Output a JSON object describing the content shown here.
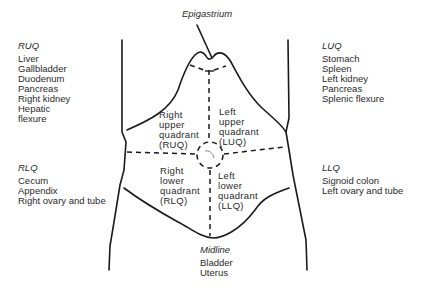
{
  "figure": {
    "top_label": "Epigastrium",
    "colors": {
      "line": "#1a1a1a",
      "text": "#2a2a2a",
      "background": "#ffffff"
    }
  },
  "regions": {
    "ruq": {
      "abbr": "RUQ",
      "organs": [
        "Liver",
        "Gallbladder",
        "Duodenum",
        "Pancreas",
        "Right kidney",
        "Hepatic",
        "flexure"
      ]
    },
    "luq": {
      "abbr": "LUQ",
      "organs": [
        "Stomach",
        "Spleen",
        "Left kidney",
        "Pancreas",
        "Splenic flexure"
      ]
    },
    "rlq": {
      "abbr": "RLQ",
      "organs": [
        "Cecum",
        "Appendix",
        "Right ovary and tube"
      ]
    },
    "llq": {
      "abbr": "LLQ",
      "organs": [
        "Signoid colon",
        "Left ovary and tube"
      ]
    },
    "midline": {
      "title": "Midline",
      "organs": [
        "Bladder",
        "Uterus"
      ]
    }
  },
  "quadrant_labels": {
    "ruq": [
      "Right",
      "upper",
      "quadrant",
      "(RUQ)"
    ],
    "luq": [
      "Left",
      "upper",
      "quadrant",
      "(LUQ)"
    ],
    "rlq": [
      "Right",
      "lower",
      "quadrant",
      "(RLQ)"
    ],
    "llq": [
      "Left",
      "lower",
      "quadrant",
      "(LLQ)"
    ]
  }
}
